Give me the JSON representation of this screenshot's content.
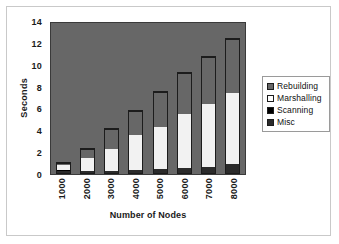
{
  "chart_data": {
    "type": "bar",
    "subtype": "stacked-vertical",
    "title": "",
    "xlabel": "Number of Nodes",
    "ylabel": "Seconds",
    "categories": [
      "1000",
      "2000",
      "3000",
      "4000",
      "5000",
      "6000",
      "7000",
      "8000"
    ],
    "ylim": [
      0,
      14
    ],
    "yticks": [
      0,
      2,
      4,
      6,
      8,
      10,
      12,
      14
    ],
    "grid": false,
    "legend_position": "right",
    "series": [
      {
        "name": "Misc",
        "color": "#2b2b2b",
        "values": [
          0.15,
          0.15,
          0.2,
          0.3,
          0.35,
          0.5,
          0.55,
          0.85
        ]
      },
      {
        "name": "Scanning",
        "color": "#000000",
        "values": [
          0.1,
          0.0,
          0.0,
          0.0,
          0.0,
          0.0,
          0.0,
          0.0
        ]
      },
      {
        "name": "Marshalling",
        "color": "#f2f2f2",
        "values": [
          0.45,
          1.2,
          2.0,
          3.2,
          3.9,
          4.9,
          5.75,
          6.45
        ]
      },
      {
        "name": "Rebuilding",
        "color": "#676767",
        "values": [
          0.1,
          0.8,
          1.7,
          2.1,
          3.1,
          3.7,
          4.25,
          4.9
        ]
      }
    ],
    "totals": [
      0.8,
      2.1,
      3.9,
      5.6,
      7.35,
      9.1,
      10.55,
      12.2
    ],
    "legend_entries": [
      "Rebuilding",
      "Marshalling",
      "Scanning",
      "Misc"
    ]
  }
}
